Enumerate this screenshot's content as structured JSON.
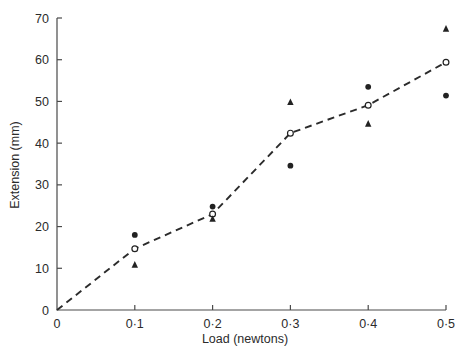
{
  "chart_data": {
    "type": "scatter",
    "title": "",
    "xlabel": "Load (newtons)",
    "ylabel": "Extension (mm)",
    "xlim": [
      0,
      0.5
    ],
    "ylim": [
      0,
      70
    ],
    "grid": false,
    "legend": "none",
    "x_tick_labels": [
      "0",
      "0·1",
      "0·2",
      "0·3",
      "0·4",
      "0·5"
    ],
    "x_tick_values": [
      0,
      0.1,
      0.2,
      0.3,
      0.4,
      0.5
    ],
    "y_tick_labels": [
      "0",
      "10",
      "20",
      "30",
      "40",
      "50",
      "60",
      "70"
    ],
    "y_tick_values": [
      0,
      10,
      20,
      30,
      40,
      50,
      60,
      70
    ],
    "x": [
      0.1,
      0.2,
      0.3,
      0.4,
      0.5
    ],
    "series": [
      {
        "name": "filled-circle",
        "marker": "filled-circle",
        "values": [
          18.0,
          24.8,
          34.6,
          53.5,
          51.4
        ]
      },
      {
        "name": "open-circle",
        "marker": "open-circle",
        "connected": true,
        "line_style": "dashed",
        "line_origin": [
          0,
          0
        ],
        "values": [
          14.7,
          23.0,
          42.4,
          49.1,
          59.4
        ]
      },
      {
        "name": "filled-triangle",
        "marker": "triangle",
        "values": [
          10.8,
          21.8,
          49.8,
          44.6,
          67.4
        ]
      }
    ]
  },
  "colors": {
    "marker": "#222222",
    "axis": "#4a4a4a",
    "text": "#2b2b2b",
    "background": "#ffffff"
  }
}
